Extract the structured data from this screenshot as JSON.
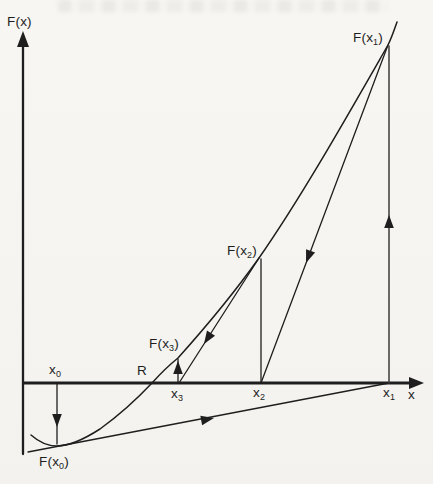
{
  "colors": {
    "ink": "#1e1e1e",
    "paper": "#f5f4f0"
  },
  "diagram": {
    "y_axis_label": "F(x)",
    "x_axis_label": "x",
    "root_label": "R",
    "curve_labels": {
      "fx0": {
        "pre": "F(x",
        "sub": "0",
        "post": ")"
      },
      "fx1": {
        "pre": "F(x",
        "sub": "1",
        "post": ")"
      },
      "fx2": {
        "pre": "F(x",
        "sub": "2",
        "post": ")"
      },
      "fx3": {
        "pre": "F(x",
        "sub": "3",
        "post": ")"
      }
    },
    "axis_point_labels": {
      "x0": {
        "pre": "x",
        "sub": "0",
        "post": ""
      },
      "x1": {
        "pre": "x",
        "sub": "1",
        "post": ""
      },
      "x2": {
        "pre": "x",
        "sub": "2",
        "post": ""
      },
      "x3": {
        "pre": "x",
        "sub": "3",
        "post": ""
      }
    }
  }
}
